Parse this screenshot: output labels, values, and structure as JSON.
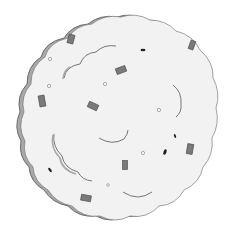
{
  "image": {
    "subject": "scalloped round cookie with sprinkles",
    "width": 227,
    "height": 236
  },
  "colors": {
    "background": "#ffffff",
    "fill": "#f2f2f2",
    "shadow": "#a8a8a8",
    "outline": "#555555",
    "sprinkle": "#7a7a7a",
    "sprinkle_dark": "#222222"
  },
  "sprinkles": [
    {
      "type": "rect",
      "x": 71,
      "y": 39,
      "w": 6,
      "h": 9,
      "rot": 15
    },
    {
      "type": "rect",
      "x": 192,
      "y": 45,
      "w": 5,
      "h": 9,
      "rot": 20
    },
    {
      "type": "rect",
      "x": 121,
      "y": 70,
      "w": 10,
      "h": 6,
      "rot": -20
    },
    {
      "type": "rect",
      "x": 42,
      "y": 101,
      "w": 6,
      "h": 11,
      "rot": -10
    },
    {
      "type": "rect",
      "x": 93,
      "y": 106,
      "w": 10,
      "h": 6,
      "rot": 25
    },
    {
      "type": "rect",
      "x": 190,
      "y": 149,
      "w": 6,
      "h": 10,
      "rot": 10
    },
    {
      "type": "rect",
      "x": 125,
      "y": 165,
      "w": 5,
      "h": 9,
      "rot": 0
    },
    {
      "type": "rect",
      "x": 86,
      "y": 198,
      "w": 10,
      "h": 6,
      "rot": 10
    },
    {
      "type": "dot",
      "x": 143,
      "y": 50,
      "rx": 2.5,
      "ry": 1.3,
      "rot": 0
    },
    {
      "type": "dot",
      "x": 175,
      "y": 136,
      "rx": 1,
      "ry": 2,
      "rot": -20
    },
    {
      "type": "dot",
      "x": 165,
      "y": 152,
      "rx": 1.5,
      "ry": 2.8,
      "rot": 20
    },
    {
      "type": "dot",
      "x": 50,
      "y": 170,
      "rx": 1.2,
      "ry": 2.5,
      "rot": -40
    }
  ],
  "circles": [
    {
      "x": 50,
      "y": 59,
      "r": 1.6
    },
    {
      "x": 49,
      "y": 86,
      "r": 1.6
    },
    {
      "x": 105,
      "y": 84,
      "r": 1.6
    },
    {
      "x": 159,
      "y": 110,
      "r": 1.6
    },
    {
      "x": 143,
      "y": 153,
      "r": 1.6
    },
    {
      "x": 108,
      "y": 185,
      "r": 1.3
    }
  ]
}
